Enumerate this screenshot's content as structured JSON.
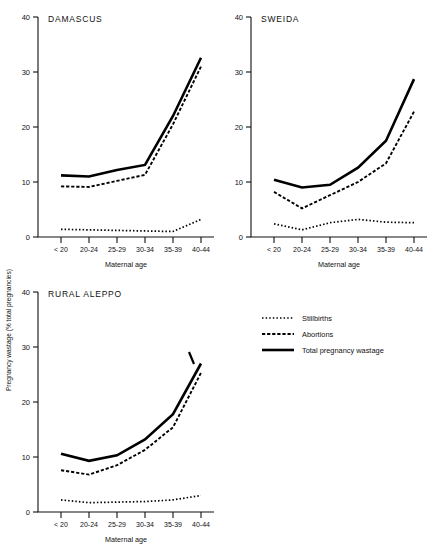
{
  "figure": {
    "ylabel": "Pregnancy wastage (% total pregnancies)",
    "xlabel": "Maternal age"
  },
  "legend": {
    "items": [
      {
        "label": "Stillbirths",
        "style": "dotted"
      },
      {
        "label": "Abortions",
        "style": "dashed"
      },
      {
        "label": "Total pregnancy wastage",
        "style": "solid"
      }
    ]
  },
  "chart_data": [
    {
      "type": "line",
      "title": "DAMASCUS",
      "xlabel": "Maternal age",
      "ylabel": "Pregnancy wastage (% total pregnancies)",
      "categories": [
        "< 20",
        "20-24",
        "25-29",
        "30-34",
        "35-39",
        "40-44"
      ],
      "ylim": [
        0,
        40
      ],
      "yticks": [
        0,
        10,
        20,
        30,
        40
      ],
      "grid": false,
      "legend_position": "figure-center-right",
      "series": [
        {
          "name": "Stillbirths",
          "values": [
            1.4,
            1.3,
            1.2,
            1.1,
            1.0,
            3.2
          ]
        },
        {
          "name": "Abortions",
          "values": [
            9.2,
            9.1,
            10.2,
            11.3,
            20.5,
            31.0
          ]
        },
        {
          "name": "Total pregnancy wastage",
          "values": [
            11.2,
            11.0,
            12.2,
            13.1,
            22.0,
            32.6
          ]
        }
      ]
    },
    {
      "type": "line",
      "title": "SWEIDA",
      "xlabel": "Maternal age",
      "ylabel": "Pregnancy wastage (% total pregnancies)",
      "categories": [
        "< 20",
        "20-24",
        "25-29",
        "30-34",
        "35-39",
        "40-44"
      ],
      "ylim": [
        0,
        40
      ],
      "yticks": [
        0,
        10,
        20,
        30,
        40
      ],
      "grid": false,
      "legend_position": "figure-center-right",
      "series": [
        {
          "name": "Stillbirths",
          "values": [
            2.4,
            1.3,
            2.6,
            3.2,
            2.7,
            2.6
          ]
        },
        {
          "name": "Abortions",
          "values": [
            8.2,
            5.2,
            7.6,
            10.0,
            13.4,
            22.8
          ]
        },
        {
          "name": "Total pregnancy wastage",
          "values": [
            10.4,
            9.0,
            9.5,
            12.6,
            17.5,
            28.7
          ]
        }
      ]
    },
    {
      "type": "line",
      "title": "RURAL ALEPPO",
      "xlabel": "Maternal age",
      "ylabel": "Pregnancy wastage (% total pregnancies)",
      "categories": [
        "< 20",
        "20-24",
        "25-29",
        "30-34",
        "35-39",
        "40-44"
      ],
      "ylim": [
        0,
        40
      ],
      "yticks": [
        0,
        10,
        20,
        30,
        40
      ],
      "grid": false,
      "legend_position": "figure-center-right",
      "series": [
        {
          "name": "Stillbirths",
          "values": [
            2.2,
            1.7,
            1.8,
            1.9,
            2.2,
            3.0
          ]
        },
        {
          "name": "Abortions",
          "values": [
            7.6,
            6.8,
            8.5,
            11.3,
            15.4,
            25.3
          ]
        },
        {
          "name": "Total pregnancy wastage",
          "values": [
            10.6,
            9.3,
            10.3,
            13.2,
            17.8,
            27.0
          ]
        }
      ]
    }
  ]
}
